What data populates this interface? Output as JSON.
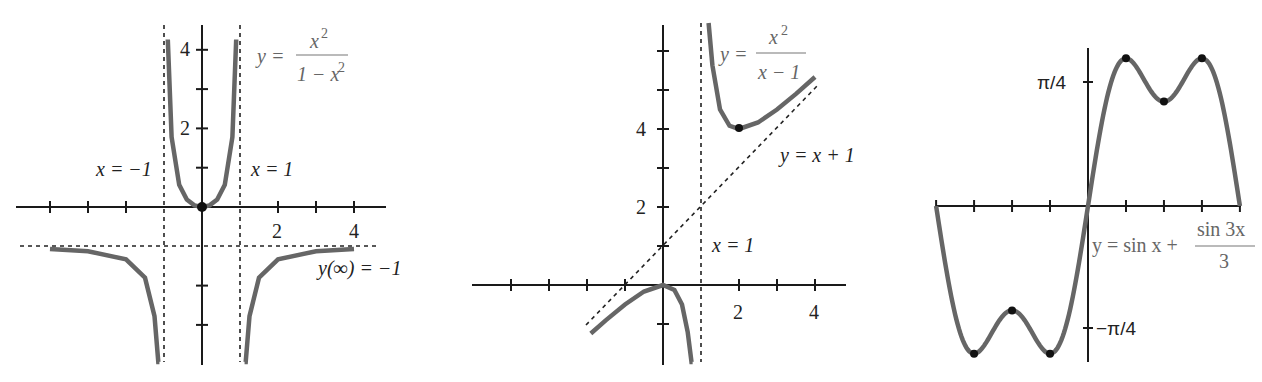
{
  "chart_data": [
    {
      "type": "line",
      "title": "y = x^2 / (1 - x^2)",
      "equation_label": {
        "lhs": "y =",
        "numerator": "x",
        "numerator_exp": "2",
        "denominator": "1 − x",
        "denominator_exp": "2"
      },
      "annotations": [
        "x = −1",
        "x = 1",
        "y(∞) = −1"
      ],
      "asymptotes": {
        "vertical": [
          -1,
          1
        ],
        "horizontal": [
          -1
        ]
      },
      "x_tick_labels": [
        "2",
        "4"
      ],
      "y_tick_labels": [
        "2",
        "4"
      ],
      "x_ticks": [
        -4,
        -3,
        -2,
        2,
        3,
        4
      ],
      "y_ticks": [
        -3,
        -2,
        1,
        2,
        3,
        4
      ],
      "xlim": [
        -4.5,
        5
      ],
      "ylim": [
        -3.8,
        4.6
      ],
      "grid": false,
      "marked_points": [
        {
          "x": 0,
          "y": 0
        }
      ],
      "series": [
        {
          "name": "left branch",
          "x": [
            -4,
            -3,
            -2,
            -1.5,
            -1.25,
            -1.15,
            -1.12
          ],
          "y": [
            -1.067,
            -1.125,
            -1.333,
            -1.8,
            -2.778,
            -4.1,
            -4.9
          ]
        },
        {
          "name": "middle branch",
          "x": [
            -0.9,
            -0.8,
            -0.6,
            -0.4,
            -0.2,
            0,
            0.2,
            0.4,
            0.6,
            0.8,
            0.9
          ],
          "y": [
            4.263,
            1.778,
            0.5625,
            0.19,
            0.042,
            0,
            0.042,
            0.19,
            0.5625,
            1.778,
            4.263
          ]
        },
        {
          "name": "right branch",
          "x": [
            1.12,
            1.15,
            1.25,
            1.5,
            2,
            3,
            4
          ],
          "y": [
            -4.9,
            -4.1,
            -2.778,
            -1.8,
            -1.333,
            -1.125,
            -1.067
          ]
        }
      ]
    },
    {
      "type": "line",
      "title": "y = x^2 / (x - 1)",
      "equation_label": {
        "lhs": "y =",
        "numerator": "x",
        "numerator_exp": "2",
        "denominator": "x − 1"
      },
      "annotations": [
        "y = x + 1",
        "x = 1"
      ],
      "asymptotes": {
        "vertical": [
          1
        ],
        "oblique": "y = x + 1"
      },
      "x_tick_labels": [
        "2",
        "4"
      ],
      "y_tick_labels": [
        "2",
        "4"
      ],
      "x_ticks": [
        -4,
        -3,
        -2,
        -1,
        2,
        3,
        4
      ],
      "y_ticks": [
        -1,
        1,
        2,
        3,
        4,
        5,
        6
      ],
      "xlim": [
        -5,
        5
      ],
      "ylim": [
        -2,
        7
      ],
      "grid": false,
      "marked_points": [
        {
          "x": 2,
          "y": 4
        }
      ],
      "series": [
        {
          "name": "left branch",
          "x": [
            -1.9,
            -1.5,
            -1,
            -0.5,
            0,
            0.3,
            0.5,
            0.65,
            0.75,
            0.78
          ],
          "y": [
            -1.245,
            -0.9,
            -0.5,
            -0.167,
            0,
            -0.129,
            -0.5,
            -1.207,
            -2.25,
            -2.77
          ]
        },
        {
          "name": "right branch",
          "x": [
            1.2,
            1.3,
            1.5,
            1.75,
            2,
            2.5,
            3,
            3.5,
            4
          ],
          "y": [
            7.2,
            5.633,
            4.5,
            4.083,
            4,
            4.167,
            4.5,
            4.9,
            5.333
          ]
        }
      ]
    },
    {
      "type": "line",
      "title": "y = sin x + sin 3x / 3",
      "equation_label": {
        "lhs": "y = sin x +",
        "numerator": "sin 3x",
        "denominator": "3"
      },
      "x_tick_labels": [],
      "y_tick_labels": [
        "π/4",
        "−π/4"
      ],
      "x_ticks_every": "π/4",
      "xlim": [
        -3.1416,
        3.1416
      ],
      "ylim": [
        -0.95,
        0.97
      ],
      "grid": false,
      "marked_points": [
        {
          "x": -2.3562,
          "y": -0.9428
        },
        {
          "x": -1.5708,
          "y": -0.6667
        },
        {
          "x": -0.7854,
          "y": -0.9428
        },
        {
          "x": 0.7854,
          "y": 0.9428
        },
        {
          "x": 1.5708,
          "y": 0.6667
        },
        {
          "x": 2.3562,
          "y": 0.9428
        }
      ],
      "series": [
        {
          "name": "y",
          "function": "sin(x) + sin(3x)/3",
          "x_range": [
            -3.1416,
            3.1416
          ]
        }
      ]
    }
  ]
}
